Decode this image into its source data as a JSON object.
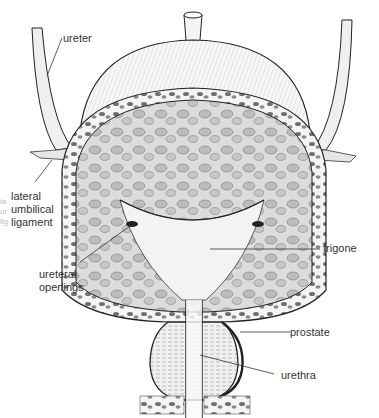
{
  "figure": {
    "colors": {
      "ink": "#1a1a1a",
      "label": "#333333",
      "tissue": "#8a8a8a",
      "lightTissue": "#d8d8d8",
      "background": "#ffffff"
    }
  },
  "labels": {
    "ureter": "ureter",
    "lateral_umbilical_ligament": [
      "lateral",
      "umbilical",
      "ligament"
    ],
    "ureteral_openings": [
      "ureteral",
      "openings"
    ],
    "trigone": "trigone",
    "prostate": "prostate",
    "urethra": "urethra"
  },
  "edge_bleed": [
    "la",
    "ur",
    "lig"
  ]
}
